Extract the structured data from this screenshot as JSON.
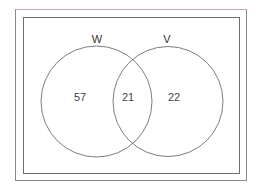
{
  "diagram": {
    "type": "venn",
    "sets": [
      {
        "name": "W",
        "only_value": "57"
      },
      {
        "name": "V",
        "only_value": "22"
      }
    ],
    "intersection_value": "21",
    "colors": {
      "stroke": "#6e6e6e",
      "text": "#444444",
      "outer_border": "#8a8a8a"
    }
  },
  "labels": {
    "set_w": "W",
    "set_v": "V",
    "w_only": "57",
    "both": "21",
    "v_only": "22"
  }
}
